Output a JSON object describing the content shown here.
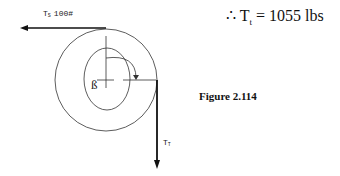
{
  "diagram": {
    "labels": {
      "tension_slack": "T",
      "tension_slack_sub": "S",
      "tension_slack_value": "100#",
      "tension_tight": "T",
      "tension_tight_sub": "T",
      "center_label": "ß"
    },
    "result": {
      "therefore": "∴",
      "symbol": "T",
      "subscript": "t",
      "equals": "= 1055 lbs"
    },
    "caption": "Figure 2.114"
  }
}
